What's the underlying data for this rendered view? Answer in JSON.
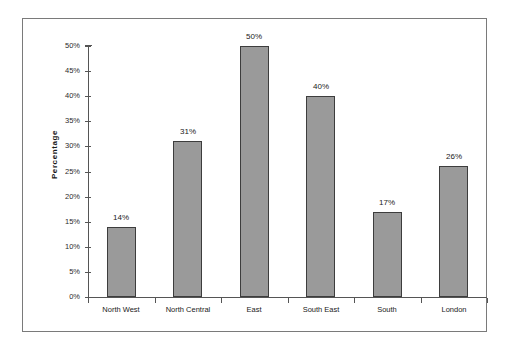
{
  "chart_data": {
    "type": "bar",
    "title": "",
    "xlabel": "",
    "ylabel": "Percentage",
    "categories": [
      "North West",
      "North Central",
      "East",
      "South East",
      "South",
      "London"
    ],
    "values": [
      14,
      31,
      50,
      40,
      17,
      26
    ],
    "value_labels": [
      "14%",
      "31%",
      "50%",
      "40%",
      "17%",
      "26%"
    ],
    "ylim": [
      0,
      50
    ],
    "ytick_labels": [
      "0%",
      "5%",
      "10%",
      "15%",
      "20%",
      "25%",
      "30%",
      "35%",
      "40%",
      "45%",
      "50%"
    ],
    "ytick_values": [
      0,
      5,
      10,
      15,
      20,
      25,
      30,
      35,
      40,
      45,
      50
    ],
    "grid": false,
    "legend": null,
    "bar_color": "#9a9a9a",
    "bar_border_color": "#3d3d3d",
    "axis_color": "#555555",
    "frame_color": "#7a7a7a",
    "background": "#ffffff"
  }
}
